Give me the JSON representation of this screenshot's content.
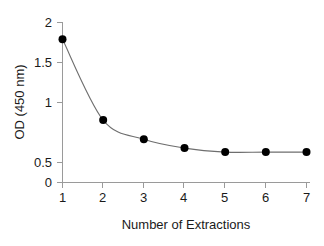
{
  "chart_data": {
    "type": "line",
    "title": "",
    "xlabel": "Number of Extractions",
    "ylabel": "OD (450 nm)",
    "x": [
      1,
      2,
      3,
      4,
      5,
      6,
      7
    ],
    "values": [
      1.79,
      0.78,
      0.54,
      0.43,
      0.38,
      0.38,
      0.38
    ],
    "series": [
      {
        "name": "OD (450 nm)",
        "values": [
          1.79,
          0.78,
          0.54,
          0.43,
          0.38,
          0.38,
          0.38
        ]
      }
    ],
    "xlim": [
      1,
      7
    ],
    "ylim": [
      0,
      2
    ],
    "xticks": [
      "1",
      "2",
      "3",
      "4",
      "5",
      "6",
      "7"
    ],
    "yticks": [
      "0",
      "0.5",
      "1",
      "1.5",
      "2"
    ],
    "ytick_values": [
      0,
      0.5,
      1,
      1.5,
      2
    ],
    "grid": false,
    "legend": "none",
    "marker": "filled-circle",
    "marker_color": "#000000",
    "line_color": "#6e6e6e",
    "axis_color": "#9a9a9a",
    "background_color": "#ffffff"
  },
  "axes": {
    "y_tick_0": "0",
    "y_tick_1": "0.5",
    "y_tick_2": "1",
    "y_tick_3": "1.5",
    "y_tick_4": "2",
    "x_tick_0": "1",
    "x_tick_1": "2",
    "x_tick_2": "3",
    "x_tick_3": "4",
    "x_tick_4": "5",
    "x_tick_5": "6",
    "x_tick_6": "7",
    "x_title": "Number of Extractions",
    "y_title": "OD (450 nm)"
  }
}
